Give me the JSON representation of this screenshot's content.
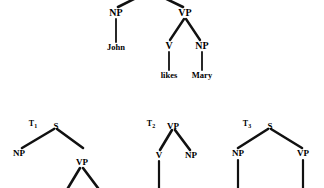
{
  "figure": {
    "background_color": "#ffffff",
    "line_color": "#111111",
    "text_color": "#000000"
  },
  "main_tree": {
    "sentence": "John likes Mary",
    "nodes": {
      "np_subject": "NP",
      "vp": "VP",
      "v": "V",
      "np_object": "NP",
      "word_john": "John",
      "word_likes": "likes",
      "word_mary": "Mary"
    }
  },
  "fragments": [
    {
      "tag": "T",
      "subscript": "1",
      "root": "S",
      "children": [
        "NP",
        "VP"
      ],
      "grandchildren": []
    },
    {
      "tag": "T",
      "subscript": "2",
      "root": "VP",
      "children": [
        "V",
        "NP"
      ],
      "grandchildren": []
    },
    {
      "tag": "T",
      "subscript": "3",
      "root": "S",
      "children": [
        "NP",
        "VP"
      ],
      "grandchildren": []
    }
  ]
}
